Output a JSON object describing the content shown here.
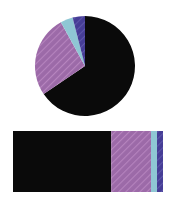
{
  "figure": {
    "title": "",
    "background_color": "#ffffff",
    "width": 177,
    "height": 200
  },
  "palette": {
    "black": "#0a0a0a",
    "magenta": "#9c6aa8",
    "cyan": "#8fc7d4",
    "indigo": "#463d96",
    "hatch_light": "#b684be",
    "hatch_indigo_light": "#5d55aa"
  },
  "chart_data": [
    {
      "type": "pie",
      "title": "",
      "xlabel": "",
      "ylabel": "",
      "categories": [
        "Category A",
        "Category B",
        "Category C",
        "Category D"
      ],
      "values": [
        65.5,
        26.5,
        4.0,
        4.0
      ],
      "colors": [
        "#0a0a0a",
        "#9c6aa8",
        "#8fc7d4",
        "#463d96"
      ],
      "hatches": [
        "",
        "//",
        "",
        "//"
      ],
      "start_angle_deg": 90,
      "direction": "clockwise",
      "legend": "none",
      "labels_shown": false,
      "center_x": 85,
      "center_y": 66,
      "radius": 50
    },
    {
      "type": "bar",
      "orientation": "horizontal",
      "stacked": true,
      "title": "",
      "xlabel": "",
      "ylabel": "",
      "categories": [
        "Category A",
        "Category B",
        "Category C",
        "Category D"
      ],
      "values": [
        65.5,
        26.5,
        4.0,
        4.0
      ],
      "colors": [
        "#0a0a0a",
        "#9c6aa8",
        "#8fc7d4",
        "#463d96"
      ],
      "hatches": [
        "",
        "//",
        "",
        "//"
      ],
      "xlim": [
        0,
        100
      ],
      "grid": false,
      "legend": "none",
      "tick_labels_shown": false,
      "bar_left": 13,
      "bar_right": 163,
      "bar_top": 5,
      "bar_height": 61
    }
  ]
}
